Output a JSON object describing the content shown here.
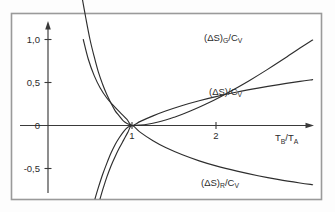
{
  "figure": {
    "background_color": "#fdfdfd",
    "frame_color": "#9a9a9a",
    "ink_color": "#2e2e2e"
  },
  "axes": {
    "x_axis_title": "T_B/T_A",
    "x_axis_title_parts": {
      "main1": "T",
      "sub1": "B",
      "slash": "/",
      "main2": "T",
      "sub2": "A"
    },
    "y_axis_title": "",
    "x_ticks": [
      "1",
      "2"
    ],
    "x_tick_values": [
      1,
      2
    ],
    "y_ticks": [
      "1,0",
      "0,5",
      "0",
      "-0,5"
    ],
    "y_tick_values": [
      1.0,
      0.5,
      0.0,
      -0.5
    ],
    "xlim": [
      0,
      3.15
    ],
    "ylim": [
      -0.85,
      1.28
    ],
    "grid": false,
    "x_arrow": true,
    "y_arrow": true
  },
  "labels": {
    "curve_g": {
      "open": "(",
      "delta": "Δ",
      "s": "S)",
      "sub": "G",
      "tail": "/C",
      "subtail": "V"
    },
    "curve_total": {
      "open": "(",
      "delta": "Δ",
      "s": "S)",
      "sub": "",
      "tail": "/C",
      "subtail": "V"
    },
    "curve_r": {
      "open": "(",
      "delta": "Δ",
      "s": "S)",
      "sub": "R",
      "tail": "/C",
      "subtail": "V"
    }
  },
  "chart_data": {
    "type": "line",
    "title": "",
    "subtitle": "",
    "xlabel": "T_B/T_A",
    "ylabel": "(ΔS)/C_V",
    "xlim": [
      0,
      3.15
    ],
    "ylim": [
      -0.85,
      1.28
    ],
    "xticks": [
      1,
      2
    ],
    "xticklabels": [
      "1",
      "2"
    ],
    "yticks": [
      -0.5,
      0,
      0.5,
      1.0
    ],
    "yticklabels": [
      "-0,5",
      "0",
      "0,5",
      "1,0"
    ],
    "grid": false,
    "legend": "inline-annotations",
    "annotations": [
      {
        "text": "(ΔS)_G/C_V",
        "x": 1.85,
        "y": 0.96
      },
      {
        "text": "(ΔS)/C_V",
        "x": 1.85,
        "y": 0.49
      },
      {
        "text": "(ΔS)_R/C_V",
        "x": 1.8,
        "y": -0.63
      }
    ],
    "series": [
      {
        "name": "(ΔS)_G/C_V",
        "comment": "x - 1 - ln(x); diverges as x->0, minimum 0 at x=1, rises for x>1",
        "x": [
          0.4,
          0.45,
          0.5,
          0.55,
          0.6,
          0.65,
          0.7,
          0.75,
          0.8,
          0.85,
          0.9,
          0.95,
          1.0,
          1.1,
          1.2,
          1.3,
          1.4,
          1.5,
          1.6,
          1.75,
          1.9,
          2.05,
          2.2,
          2.4,
          2.6,
          2.8,
          3.0,
          3.15
        ],
        "y": [
          1.52,
          1.25,
          1.0,
          0.8,
          0.62,
          0.48,
          0.36,
          0.26,
          0.17,
          0.11,
          0.05,
          0.02,
          0.0,
          0.005,
          0.018,
          0.038,
          0.064,
          0.095,
          0.13,
          0.191,
          0.258,
          0.332,
          0.412,
          0.524,
          0.644,
          0.77,
          0.901,
          0.993
        ]
      },
      {
        "name": "(ΔS)/C_V",
        "comment": "ln(x) type gentle rise, also steep negative branch for x<1",
        "x": [
          0.42,
          0.48,
          0.55,
          0.62,
          0.7,
          0.78,
          0.86,
          0.94,
          1.0,
          1.1,
          1.25,
          1.4,
          1.6,
          1.8,
          2.0,
          2.25,
          2.5,
          2.75,
          3.0,
          3.15
        ],
        "y": [
          1.0,
          0.77,
          0.58,
          0.44,
          0.32,
          0.23,
          0.15,
          0.07,
          0.0,
          0.048,
          0.112,
          0.168,
          0.233,
          0.288,
          0.336,
          0.389,
          0.435,
          0.476,
          0.513,
          0.533
        ]
      },
      {
        "name": "(ΔS)_R/C_V",
        "comment": "ln(x) - (x-1)/x ; negative for x>1, plunges steeply for x<1",
        "x": [
          0.62,
          0.66,
          0.7,
          0.75,
          0.8,
          0.85,
          0.9,
          0.95,
          1.0,
          1.1,
          1.25,
          1.4,
          1.6,
          1.8,
          2.0,
          2.25,
          2.5,
          2.75,
          3.0,
          3.15
        ],
        "y": [
          -0.85,
          -0.72,
          -0.6,
          -0.47,
          -0.36,
          -0.26,
          -0.17,
          -0.08,
          0.0,
          -0.08,
          -0.178,
          -0.257,
          -0.341,
          -0.411,
          -0.47,
          -0.531,
          -0.584,
          -0.629,
          -0.668,
          -0.689
        ]
      },
      {
        "name": "total-lower-branch",
        "comment": "steep left branch of the (ΔS)_G curve below x=1, reaching the frame bottom",
        "x": [
          0.56,
          0.6,
          0.65,
          0.7,
          0.75,
          0.8,
          0.85,
          0.9,
          0.95,
          1.0
        ],
        "y": [
          -0.85,
          -0.72,
          -0.57,
          -0.44,
          -0.32,
          -0.22,
          -0.14,
          -0.07,
          -0.02,
          0.0
        ]
      }
    ]
  }
}
